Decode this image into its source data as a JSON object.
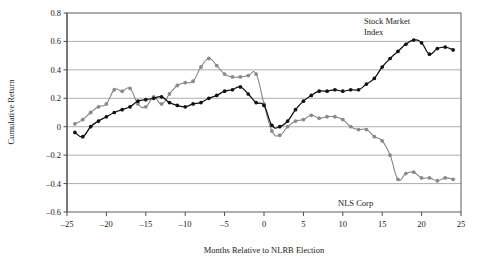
{
  "chart_data": {
    "type": "line",
    "title": "",
    "xlabel": "Months Relative to NLRB Election",
    "ylabel": "Cumulative Return",
    "xlim": [
      -25,
      25
    ],
    "ylim": [
      -0.6,
      0.8
    ],
    "xticks": [
      -25,
      -20,
      -15,
      -10,
      -5,
      0,
      5,
      10,
      15,
      20,
      25
    ],
    "xtick_labels": [
      "–25",
      "–20",
      "–15",
      "–10",
      "–5",
      "0",
      "5",
      "10",
      "15",
      "20",
      "25"
    ],
    "yticks": [
      -0.6,
      -0.4,
      -0.2,
      0,
      0.2,
      0.4,
      0.6,
      0.8
    ],
    "ytick_labels": [
      "–0.6",
      "–0.4",
      "–0.2",
      "0",
      "0.2",
      "0.4",
      "0.6",
      "0.8"
    ],
    "grid": "horizontal",
    "legend": "annotations",
    "markers": true,
    "series": [
      {
        "name": "NLS Corp",
        "color": "#808080",
        "marker_color": "#8a8a8a",
        "x": [
          -24,
          -23,
          -22,
          -21,
          -20,
          -19,
          -18,
          -17,
          -16,
          -15,
          -14,
          -13,
          -12,
          -11,
          -10,
          -9,
          -8,
          -7,
          -6,
          -5,
          -4,
          -3,
          -2,
          -1,
          0,
          1,
          2,
          3,
          4,
          5,
          6,
          7,
          8,
          9,
          10,
          11,
          12,
          13,
          14,
          15,
          16,
          17,
          18,
          19,
          20,
          21,
          22,
          23,
          24
        ],
        "values": [
          0.02,
          0.05,
          0.1,
          0.14,
          0.16,
          0.26,
          0.25,
          0.27,
          0.16,
          0.14,
          0.21,
          0.16,
          0.23,
          0.29,
          0.31,
          0.32,
          0.42,
          0.48,
          0.43,
          0.37,
          0.35,
          0.35,
          0.36,
          0.37,
          0.16,
          -0.03,
          -0.06,
          0.0,
          0.04,
          0.05,
          0.08,
          0.06,
          0.07,
          0.07,
          0.05,
          0.0,
          -0.02,
          -0.02,
          -0.07,
          -0.1,
          -0.2,
          -0.37,
          -0.33,
          -0.32,
          -0.36,
          -0.36,
          -0.38,
          -0.36,
          -0.37
        ]
      },
      {
        "name": "Stock Market Index",
        "color": "#111111",
        "marker_color": "#111111",
        "x": [
          -24,
          -23,
          -22,
          -21,
          -20,
          -19,
          -18,
          -17,
          -16,
          -15,
          -14,
          -13,
          -12,
          -11,
          -10,
          -9,
          -8,
          -7,
          -6,
          -5,
          -4,
          -3,
          -2,
          -1,
          0,
          1,
          2,
          3,
          4,
          5,
          6,
          7,
          8,
          9,
          10,
          11,
          12,
          13,
          14,
          15,
          16,
          17,
          18,
          19,
          20,
          21,
          22,
          23,
          24
        ],
        "values": [
          -0.04,
          -0.07,
          0.0,
          0.04,
          0.07,
          0.1,
          0.12,
          0.14,
          0.18,
          0.19,
          0.2,
          0.21,
          0.17,
          0.15,
          0.14,
          0.16,
          0.17,
          0.2,
          0.22,
          0.25,
          0.26,
          0.28,
          0.23,
          0.17,
          0.15,
          0.01,
          0.0,
          0.04,
          0.12,
          0.18,
          0.22,
          0.25,
          0.25,
          0.26,
          0.25,
          0.26,
          0.26,
          0.3,
          0.34,
          0.42,
          0.48,
          0.53,
          0.58,
          0.61,
          0.59,
          0.51,
          0.55,
          0.56,
          0.54
        ]
      }
    ],
    "annotations": [
      {
        "text_line1": "Stock Market",
        "text_line2": "Index",
        "x_px": 364,
        "y_px": 24
      },
      {
        "text_line1": "NLS Corp",
        "text_line2": "",
        "x_px": 338,
        "y_px": 206
      }
    ],
    "faint_top_text": ""
  }
}
